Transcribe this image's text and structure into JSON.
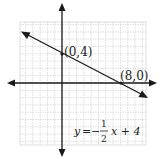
{
  "chart_data": {
    "type": "line",
    "title": "",
    "xlabel": "",
    "ylabel": "",
    "xlim": [
      -6,
      11
    ],
    "ylim": [
      -8,
      8
    ],
    "grid": true,
    "series": [
      {
        "name": "y = -1/2 x + 4",
        "slope": -0.5,
        "intercept": 4,
        "x": [
          -6,
          0,
          8,
          11
        ],
        "y": [
          7,
          4,
          0,
          -1.5
        ]
      }
    ],
    "points": [
      {
        "label": "(0,4)",
        "x": 0,
        "y": 4
      },
      {
        "label": "(8,0)",
        "x": 8,
        "y": 0
      }
    ],
    "equation": {
      "lhs": "y",
      "eq": "=",
      "minus": "−",
      "num": "1",
      "den": "2",
      "rest": "x + 4"
    }
  },
  "colors": {
    "axis": "#1a1a1a",
    "grid": "#c8c8c8",
    "line": "#1a1a1a",
    "text": "#222222"
  }
}
